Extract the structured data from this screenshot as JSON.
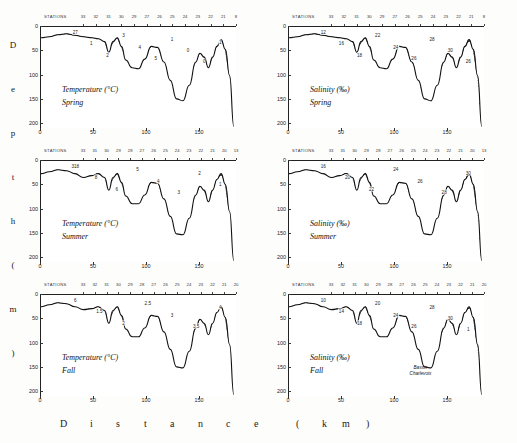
{
  "figure": {
    "xlabel_chars": [
      "D",
      "i",
      "s",
      "t",
      "a",
      "n",
      "c",
      "e",
      "(",
      "k",
      "m",
      ")"
    ],
    "ylabel_chars": [
      "D",
      "e",
      "p",
      "t",
      "h",
      "(",
      "m",
      ")"
    ],
    "station_header": "STATIONS",
    "basin_annotation_line1": "Bassin",
    "basin_annotation_line2": "Charlevoix",
    "accent_color": "#1a1a1a",
    "stipple_color": "#2b2b2b"
  },
  "axes": {
    "x_ticks": [
      "0",
      "50",
      "100",
      "150"
    ],
    "x_values": [
      0,
      50,
      100,
      150
    ],
    "x_range": [
      0,
      185
    ],
    "y_ticks_left": [
      "0",
      "50",
      "100",
      "150",
      "200"
    ],
    "y_ticks_right": [
      "0",
      "50",
      "100",
      "150",
      "200"
    ],
    "y_values": [
      0,
      50,
      100,
      150,
      200
    ],
    "y_range": [
      0,
      210
    ]
  },
  "chart_data": {
    "type": "line",
    "title": "",
    "xlabel": "Distance (km)",
    "ylabel": "Depth (m)",
    "xlim": [
      0,
      185
    ],
    "ylim": [
      210,
      0
    ],
    "grid": false,
    "legend": "none",
    "panels": [
      {
        "id": "temperature-spring",
        "variable": "Temperature",
        "units": "(°C)",
        "season": "Spring",
        "caption_line1": "Temperature (°C)",
        "caption_line2": "Spring",
        "contour_labels": [
          "27",
          "1",
          "2",
          "3",
          "4",
          "5",
          "1",
          "0",
          "0",
          "1"
        ],
        "stations": [
          "33",
          "32",
          "31",
          "30",
          "29",
          "27",
          "26",
          "25",
          "24",
          "23",
          "22",
          "21",
          "8"
        ],
        "bathymetry_x": [
          0,
          8,
          16,
          24,
          32,
          40,
          48,
          54,
          60,
          64,
          68,
          72,
          76,
          80,
          86,
          92,
          98,
          104,
          110,
          116,
          122,
          128,
          134,
          140,
          146,
          150,
          154,
          158,
          162,
          166,
          170,
          174,
          178,
          182
        ],
        "bathymetry_depth": [
          22,
          20,
          16,
          14,
          17,
          20,
          22,
          24,
          30,
          52,
          30,
          22,
          40,
          68,
          84,
          86,
          66,
          40,
          42,
          72,
          110,
          148,
          152,
          120,
          72,
          54,
          62,
          84,
          62,
          40,
          26,
          46,
          100,
          205
        ]
      },
      {
        "id": "salinity-spring",
        "variable": "Salinity",
        "units": "(‰)",
        "season": "Spring",
        "caption_line1": "Salinity (‰)",
        "caption_line2": "Spring",
        "contour_labels": [
          "12",
          "16",
          "18",
          "22",
          "24",
          "26",
          "28",
          "30",
          "26"
        ],
        "stations": [
          "33",
          "32",
          "31",
          "30",
          "29",
          "27",
          "26",
          "25",
          "24",
          "23",
          "22",
          "21",
          "8"
        ],
        "bathymetry_x": [
          0,
          8,
          16,
          24,
          32,
          40,
          48,
          54,
          60,
          64,
          68,
          72,
          76,
          80,
          86,
          92,
          98,
          104,
          110,
          116,
          122,
          128,
          134,
          140,
          146,
          150,
          154,
          158,
          162,
          166,
          170,
          174,
          178,
          182
        ],
        "bathymetry_depth": [
          22,
          20,
          16,
          14,
          17,
          20,
          22,
          24,
          30,
          52,
          30,
          22,
          40,
          68,
          84,
          86,
          66,
          40,
          42,
          72,
          110,
          148,
          152,
          120,
          72,
          54,
          62,
          84,
          62,
          40,
          26,
          46,
          100,
          205
        ]
      },
      {
        "id": "temperature-summer",
        "variable": "Temperature",
        "units": "(°C)",
        "season": "Summer",
        "caption_line1": "Temperature (°C)",
        "caption_line2": "Summer",
        "contour_labels": [
          "318",
          "8",
          "6",
          "5",
          "4",
          "3",
          "2",
          "1"
        ],
        "stations": [
          "33",
          "31",
          "30",
          "29",
          "28",
          "27",
          "26",
          "25",
          "24",
          "23",
          "22",
          "21",
          "20",
          "13"
        ],
        "bathymetry_x": [
          0,
          8,
          16,
          24,
          32,
          40,
          48,
          54,
          60,
          64,
          68,
          72,
          76,
          80,
          86,
          92,
          98,
          104,
          110,
          116,
          122,
          128,
          134,
          140,
          146,
          150,
          154,
          158,
          162,
          166,
          170,
          174,
          178,
          182
        ],
        "bathymetry_depth": [
          26,
          22,
          18,
          20,
          26,
          34,
          30,
          26,
          34,
          60,
          34,
          26,
          44,
          72,
          88,
          88,
          70,
          44,
          46,
          78,
          114,
          150,
          152,
          118,
          70,
          52,
          60,
          84,
          60,
          38,
          26,
          48,
          104,
          205
        ]
      },
      {
        "id": "salinity-summer",
        "variable": "Salinity",
        "units": "(‰)",
        "season": "Summer",
        "caption_line1": "Salinity (‰)",
        "caption_line2": "Summer",
        "contour_labels": [
          "16",
          "20",
          "22",
          "24",
          "26",
          "28",
          "30"
        ],
        "stations": [
          "33",
          "31",
          "30",
          "29",
          "28",
          "27",
          "26",
          "25",
          "24",
          "23",
          "22",
          "21",
          "20",
          "13"
        ],
        "bathymetry_x": [
          0,
          8,
          16,
          24,
          32,
          40,
          48,
          54,
          60,
          64,
          68,
          72,
          76,
          80,
          86,
          92,
          98,
          104,
          110,
          116,
          122,
          128,
          134,
          140,
          146,
          150,
          154,
          158,
          162,
          166,
          170,
          174,
          178,
          182
        ],
        "bathymetry_depth": [
          26,
          22,
          18,
          20,
          26,
          34,
          30,
          26,
          34,
          60,
          34,
          26,
          44,
          72,
          88,
          88,
          70,
          44,
          46,
          78,
          114,
          150,
          152,
          118,
          70,
          52,
          60,
          84,
          60,
          38,
          26,
          48,
          104,
          205
        ]
      },
      {
        "id": "temperature-fall",
        "variable": "Temperature",
        "units": "(°C)",
        "season": "Fall",
        "caption_line1": "Temperature (°C)",
        "caption_line2": "Fall",
        "contour_labels": [
          "6",
          "1.5",
          "2",
          "2.5",
          "3",
          "3.5",
          "4"
        ],
        "stations": [
          "33",
          "32",
          "31",
          "30",
          "29",
          "28",
          "27",
          "26",
          "25",
          "24",
          "23",
          "22",
          "21",
          "20"
        ],
        "bathymetry_x": [
          0,
          8,
          16,
          24,
          32,
          40,
          48,
          54,
          60,
          64,
          68,
          72,
          76,
          80,
          86,
          92,
          98,
          104,
          110,
          116,
          122,
          128,
          134,
          140,
          146,
          150,
          154,
          158,
          162,
          166,
          170,
          174,
          178,
          182
        ],
        "bathymetry_depth": [
          24,
          20,
          16,
          18,
          24,
          30,
          28,
          24,
          32,
          58,
          32,
          24,
          42,
          70,
          86,
          86,
          68,
          42,
          44,
          76,
          112,
          148,
          150,
          116,
          68,
          50,
          58,
          82,
          58,
          36,
          24,
          46,
          102,
          205
        ]
      },
      {
        "id": "salinity-fall",
        "variable": "Salinity",
        "units": "(‰)",
        "season": "Fall",
        "caption_line1": "Salinity (‰)",
        "caption_line2": "Fall",
        "contour_labels": [
          "10",
          "14",
          "18",
          "20",
          "24",
          "26",
          "28",
          "30",
          "1"
        ],
        "stations": [
          "33",
          "32",
          "31",
          "30",
          "29",
          "28",
          "27",
          "26",
          "25",
          "24",
          "23",
          "22",
          "21",
          "20"
        ],
        "bathymetry_x": [
          0,
          8,
          16,
          24,
          32,
          40,
          48,
          54,
          60,
          64,
          68,
          72,
          76,
          80,
          86,
          92,
          98,
          104,
          110,
          116,
          122,
          128,
          134,
          140,
          146,
          150,
          154,
          158,
          162,
          166,
          170,
          174,
          178,
          182
        ],
        "bathymetry_depth": [
          24,
          20,
          16,
          18,
          24,
          30,
          28,
          24,
          32,
          58,
          32,
          24,
          42,
          70,
          86,
          86,
          68,
          42,
          44,
          76,
          112,
          148,
          150,
          116,
          68,
          50,
          58,
          82,
          58,
          36,
          24,
          46,
          102,
          205
        ]
      }
    ]
  }
}
